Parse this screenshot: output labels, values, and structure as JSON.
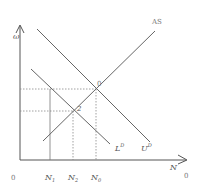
{
  "diagram": {
    "type": "labor-market",
    "y_axis_label": "ω",
    "x_axis_label": "N",
    "origin_label": "0",
    "x_end_label": "0",
    "curves": {
      "supply": {
        "label": "AS"
      },
      "demand_upper": {
        "label": "U",
        "sup": "D"
      },
      "demand_lower": {
        "label": "L",
        "sup": "D"
      }
    },
    "points": {
      "p0": {
        "label": "0"
      },
      "p2": {
        "label": "2"
      }
    },
    "x_ticks": [
      {
        "label": "N",
        "sub": "1"
      },
      {
        "label": "N",
        "sub": "2"
      },
      {
        "label": "N",
        "sub": "0"
      }
    ],
    "colors": {
      "line": "#666666",
      "axis": "#555555",
      "dotted": "#888888"
    }
  }
}
